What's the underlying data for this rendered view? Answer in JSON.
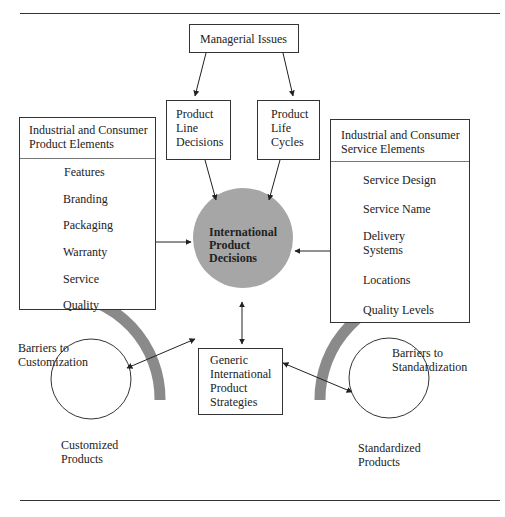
{
  "managerial": {
    "label": "Managerial Issues"
  },
  "product_line": {
    "lines": [
      "Product",
      "Line",
      "Decisions"
    ]
  },
  "product_life": {
    "lines": [
      "Product",
      "Life",
      "Cycles"
    ]
  },
  "product_elements": {
    "title_lines": [
      "Industrial and Consumer",
      "Product Elements"
    ],
    "items": [
      "Features",
      "Branding",
      "Packaging",
      "Warranty",
      "Service",
      "Quality"
    ]
  },
  "service_elements": {
    "title_lines": [
      "Industrial and Consumer",
      "Service Elements"
    ],
    "items": [
      "Service Design",
      "Service Name",
      "Delivery",
      "Systems",
      "Locations",
      "Quality Levels"
    ]
  },
  "center": {
    "lines": [
      "International",
      "Product",
      "Decisions"
    ],
    "color": "#a6a6a6"
  },
  "generic": {
    "lines": [
      "Generic",
      "International",
      "Product",
      "Strategies"
    ]
  },
  "barrier_custom": {
    "lines": [
      "Barriers to",
      "Customization"
    ]
  },
  "barrier_standard": {
    "lines": [
      "Barriers to",
      "Standardization"
    ]
  },
  "customized": {
    "lines": [
      "Customized",
      "Products"
    ]
  },
  "standardized": {
    "lines": [
      "Standardized",
      "Products"
    ]
  },
  "colors": {
    "arc": "#8a8a8a",
    "line": "#333333"
  }
}
